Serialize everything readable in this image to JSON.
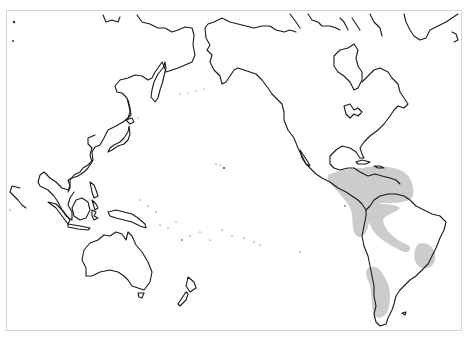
{
  "map": {
    "projection": "Pacific-centered world outline",
    "colors": {
      "background": "#ffffff",
      "coastline": "#1a1a1a",
      "range_fill": "#cccccc",
      "frame": "#d4d4d4"
    },
    "regions_outlined": [
      "East Asia",
      "Southeast Asia",
      "Australia",
      "New Zealand",
      "Pacific Islands",
      "North America",
      "Central America",
      "South America",
      "Greenland"
    ],
    "distribution_ranges": [
      {
        "name": "Central America & northern South America"
      },
      {
        "name": "Amazon basin arc"
      },
      {
        "name": "Southeastern Brazil"
      },
      {
        "name": "Southern Chile"
      }
    ]
  }
}
